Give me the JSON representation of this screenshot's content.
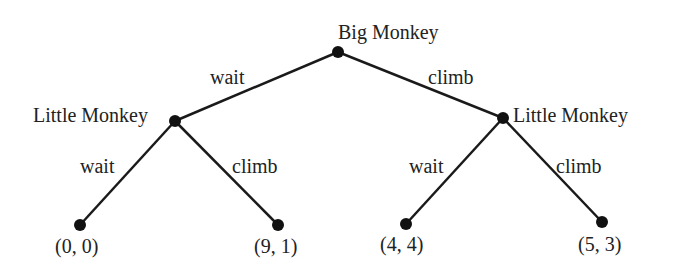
{
  "nodes": {
    "root": {
      "label": "Big Monkey",
      "x": 338,
      "y": 52
    },
    "left": {
      "label": "Little Monkey",
      "x": 175,
      "y": 121
    },
    "right": {
      "label": "Little Monkey",
      "x": 503,
      "y": 118
    }
  },
  "edges": {
    "root_left": "wait",
    "root_right": "climb",
    "left_left": "wait",
    "left_right": "climb",
    "right_left": "wait",
    "right_right": "climb"
  },
  "payoffs": [
    "(0, 0)",
    "(9, 1)",
    "(4, 4)",
    "(5, 3)"
  ],
  "colors": {
    "line": "#1a1a1a",
    "text": "#222222",
    "background": "#ffffff"
  }
}
